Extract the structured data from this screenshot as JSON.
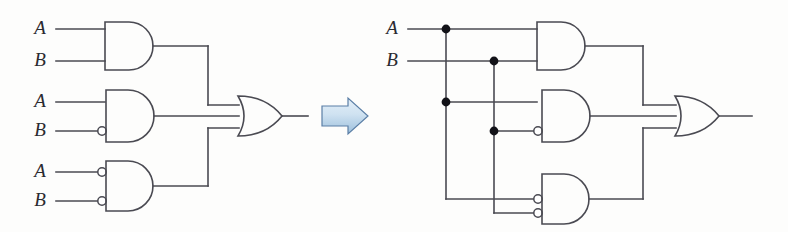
{
  "figure": {
    "background_color": "#fdfdfc",
    "wire_color": "#4a4a52",
    "junction_color": "#121218",
    "arrow_fill_start": "#dce9f5",
    "arrow_fill_end": "#9dc0dd",
    "arrow_stroke": "#5b7fa6"
  },
  "transform_arrow": {
    "name": "right-arrow",
    "direction": "right",
    "label": ""
  },
  "left_circuit": {
    "name": "left-circuit",
    "caption": "",
    "inputs": [
      {
        "id": "l-in-a1",
        "label": "A",
        "x": 40,
        "y": 29
      },
      {
        "id": "l-in-b1",
        "label": "B",
        "x": 40,
        "y": 61
      },
      {
        "id": "l-in-a2",
        "label": "A",
        "x": 40,
        "y": 102
      },
      {
        "id": "l-in-b2",
        "label": "B",
        "x": 40,
        "y": 131
      },
      {
        "id": "l-in-a3",
        "label": "A",
        "x": 40,
        "y": 172
      },
      {
        "id": "l-in-b3",
        "label": "B",
        "x": 40,
        "y": 201
      }
    ],
    "gates": [
      {
        "id": "l-g1",
        "type": "AND",
        "inverted_inputs": [],
        "inputs": [
          "A",
          "B"
        ]
      },
      {
        "id": "l-g2",
        "type": "AND",
        "inverted_inputs": [
          "B"
        ],
        "inputs": [
          "A",
          "B"
        ]
      },
      {
        "id": "l-g3",
        "type": "AND",
        "inverted_inputs": [
          "A",
          "B"
        ],
        "inputs": [
          "A",
          "B"
        ]
      },
      {
        "id": "l-or",
        "type": "OR",
        "inverted_inputs": [],
        "inputs": [
          "l-g1",
          "l-g2",
          "l-g3"
        ]
      }
    ],
    "output": {
      "id": "l-out",
      "label": ""
    },
    "junctions": []
  },
  "right_circuit": {
    "name": "right-circuit",
    "caption": "",
    "inputs": [
      {
        "id": "r-in-a",
        "label": "A",
        "x": 392,
        "y": 29
      },
      {
        "id": "r-in-b",
        "label": "B",
        "x": 392,
        "y": 61
      }
    ],
    "gates": [
      {
        "id": "r-g1",
        "type": "AND",
        "inverted_inputs": [],
        "inputs": [
          "A",
          "B"
        ]
      },
      {
        "id": "r-g2",
        "type": "AND",
        "inverted_inputs": [
          "B"
        ],
        "inputs": [
          "A",
          "B"
        ]
      },
      {
        "id": "r-g3",
        "type": "AND",
        "inverted_inputs": [
          "A",
          "B"
        ],
        "inputs": [
          "A",
          "B"
        ]
      },
      {
        "id": "r-or",
        "type": "OR",
        "inverted_inputs": [],
        "inputs": [
          "r-g1",
          "r-g2",
          "r-g3"
        ]
      }
    ],
    "output": {
      "id": "r-out",
      "label": ""
    },
    "junctions": [
      {
        "id": "r-dot-a-top",
        "x": 446,
        "y": 29
      },
      {
        "id": "r-dot-b-top",
        "x": 494,
        "y": 61
      },
      {
        "id": "r-dot-a-mid",
        "x": 446,
        "y": 102
      },
      {
        "id": "r-dot-b-mid",
        "x": 494,
        "y": 131
      }
    ]
  }
}
